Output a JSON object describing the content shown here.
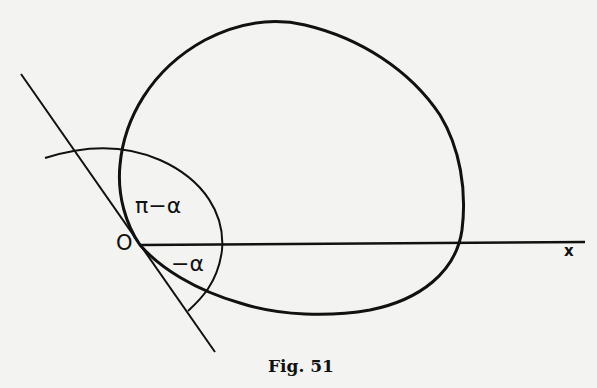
{
  "figure": {
    "caption": "Fig. 51",
    "labels": {
      "origin": "O",
      "x_axis": "x",
      "upper_angle": "π−α",
      "lower_angle": "−α"
    },
    "elements": {
      "curve": "closed-curve through origin",
      "tangent_line": "tangent at O",
      "x_axis": "horizontal ray from O",
      "angle_arc": "arc centered at O spanning from tangent to tangent"
    },
    "colors": {
      "ink": "#111111",
      "paper": "#f3f3f1"
    }
  }
}
